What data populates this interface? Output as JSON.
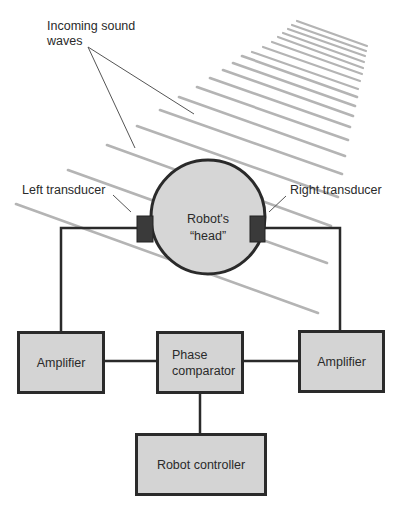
{
  "diagram": {
    "title_label": {
      "line1": "Incoming sound",
      "line2": "waves"
    },
    "head": {
      "line1": "Robot's",
      "line2": "“head”"
    },
    "left_transducer_label": "Left transducer",
    "right_transducer_label": "Right transducer",
    "boxes": {
      "left_amplifier": "Amplifier",
      "phase_comparator_line1": "Phase",
      "phase_comparator_line2": "comparator",
      "right_amplifier": "Amplifier",
      "robot_controller": "Robot controller"
    },
    "caption_partial": "Figure . . . (cut off)",
    "colors": {
      "outline": "#2a2a2a",
      "box_fill": "#d4d4d4",
      "head_fill": "#d6d6d6",
      "transducer_fill": "#3a3a3a",
      "wave_line": "#b4b4b4",
      "pointer_line": "#555555"
    },
    "wave_lines": [
      {
        "x1": 297,
        "y1": 21,
        "x2": 367,
        "y2": 46
      },
      {
        "x1": 292,
        "y1": 25,
        "x2": 366,
        "y2": 51
      },
      {
        "x1": 288,
        "y1": 29,
        "x2": 365,
        "y2": 56
      },
      {
        "x1": 283,
        "y1": 33,
        "x2": 364,
        "y2": 62
      },
      {
        "x1": 278,
        "y1": 37,
        "x2": 363,
        "y2": 68
      },
      {
        "x1": 272,
        "y1": 42,
        "x2": 362,
        "y2": 74
      },
      {
        "x1": 263,
        "y1": 47,
        "x2": 360,
        "y2": 81
      },
      {
        "x1": 252,
        "y1": 52,
        "x2": 358,
        "y2": 89
      },
      {
        "x1": 242,
        "y1": 56,
        "x2": 357,
        "y2": 97
      },
      {
        "x1": 233,
        "y1": 63,
        "x2": 355,
        "y2": 106
      },
      {
        "x1": 223,
        "y1": 70,
        "x2": 353,
        "y2": 116
      },
      {
        "x1": 210,
        "y1": 78,
        "x2": 350,
        "y2": 127
      },
      {
        "x1": 197,
        "y1": 87,
        "x2": 348,
        "y2": 140
      },
      {
        "x1": 179,
        "y1": 97,
        "x2": 345,
        "y2": 156
      },
      {
        "x1": 160,
        "y1": 110,
        "x2": 342,
        "y2": 174
      },
      {
        "x1": 137,
        "y1": 126,
        "x2": 338,
        "y2": 197
      },
      {
        "x1": 107,
        "y1": 145,
        "x2": 331,
        "y2": 226
      },
      {
        "x1": 68,
        "y1": 170,
        "x2": 327,
        "y2": 263
      },
      {
        "x1": 16,
        "y1": 204,
        "x2": 318,
        "y2": 313
      }
    ]
  }
}
